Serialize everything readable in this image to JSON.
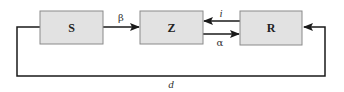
{
  "diagram": {
    "nodes": [
      {
        "id": "S",
        "label": "S"
      },
      {
        "id": "Z",
        "label": "Z"
      },
      {
        "id": "R",
        "label": "R"
      }
    ],
    "edges": [
      {
        "from": "S",
        "to": "Z",
        "label": "β"
      },
      {
        "from": "R",
        "to": "Z",
        "label": "i"
      },
      {
        "from": "Z",
        "to": "R",
        "label": "α"
      },
      {
        "from": "S",
        "to": "R",
        "label": "d"
      }
    ],
    "colors": {
      "box_fill": "#e2e2e2",
      "box_stroke": "#8a8a8a",
      "line": "#1a1a1a"
    }
  }
}
